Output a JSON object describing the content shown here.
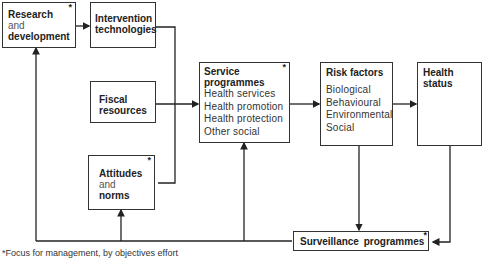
{
  "boxes": {
    "research": {
      "title1": "Research",
      "and": "and",
      "title2": "development",
      "star": "*"
    },
    "intervention": {
      "title": "Intervention technologies"
    },
    "fiscal": {
      "title": "Fiscal resources"
    },
    "attitudes": {
      "title1": "Attitudes",
      "and": "and",
      "title2": "norms",
      "star": "*"
    },
    "service": {
      "title": "Service programmes",
      "star": "*",
      "items": [
        "Health services",
        "Health promotion",
        "Health protection",
        "Other social"
      ]
    },
    "risk": {
      "title": "Risk factors",
      "items": [
        "Biological",
        "Behavioural",
        "Environmental",
        "Social"
      ]
    },
    "health": {
      "title": "Health status"
    },
    "surveillance": {
      "title": "Surveillance programmes",
      "star": "*"
    }
  },
  "footnote": "*Focus for management, by objectives effort"
}
